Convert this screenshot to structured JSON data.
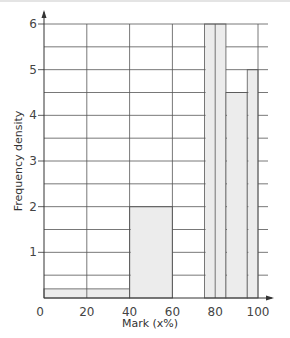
{
  "chart_data": {
    "type": "bar",
    "subtype": "histogram",
    "title": "",
    "xlabel": "Mark (x%)",
    "ylabel": "Frequency density",
    "xlim": [
      0,
      100
    ],
    "ylim": [
      0,
      6
    ],
    "x_ticks": [
      0,
      20,
      40,
      60,
      80,
      100
    ],
    "y_ticks": [
      1,
      2,
      3,
      4,
      5,
      6
    ],
    "grid": true,
    "grid_minor_y_step": 0.5,
    "legend": null,
    "bins": [
      {
        "from": 0,
        "to": 40,
        "frequency_density": 0.2
      },
      {
        "from": 40,
        "to": 60,
        "frequency_density": 2
      },
      {
        "from": 75,
        "to": 85,
        "frequency_density": 6
      },
      {
        "from": 85,
        "to": 95,
        "frequency_density": 4.5
      },
      {
        "from": 95,
        "to": 100,
        "frequency_density": 5
      }
    ],
    "colors": {
      "bar_fill": "#ececec",
      "bar_stroke": "#777777",
      "grid": "#555555",
      "axis": "#333333"
    }
  },
  "labels": {
    "x_axis_title": "Mark (x%)",
    "y_axis_title": "Frequency density",
    "x_ticks": [
      "0",
      "20",
      "40",
      "60",
      "80",
      "100"
    ],
    "y_ticks": [
      "1",
      "2",
      "3",
      "4",
      "5",
      "6"
    ]
  }
}
